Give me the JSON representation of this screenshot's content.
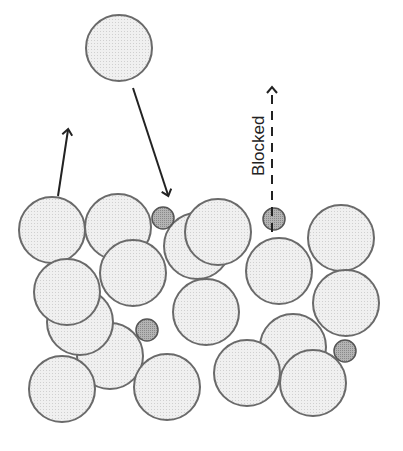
{
  "diagram": {
    "label_blocked": "Blocked",
    "colors": {
      "large_fill": "#ececec",
      "large_stroke": "#6a6a6a",
      "small_fill": "#a8a8a8",
      "small_stroke": "#555555",
      "arrow": "#222222"
    },
    "falling_particle": {
      "cx": 119,
      "cy": 48,
      "r": 33
    },
    "arrows": [
      {
        "name": "escape-arrow",
        "x1": 58,
        "y1": 196,
        "x2": 68,
        "y2": 130,
        "style": "solid"
      },
      {
        "name": "deposit-arrow",
        "x1": 133,
        "y1": 88,
        "x2": 168,
        "y2": 195,
        "style": "solid"
      },
      {
        "name": "blocked-arrow",
        "x1": 272,
        "y1": 232,
        "x2": 272,
        "y2": 88,
        "style": "dashed"
      }
    ],
    "large_particles": [
      {
        "cx": 52,
        "cy": 230,
        "r": 33
      },
      {
        "cx": 118,
        "cy": 227,
        "r": 33
      },
      {
        "cx": 197,
        "cy": 246,
        "r": 33
      },
      {
        "cx": 218,
        "cy": 232,
        "r": 33
      },
      {
        "cx": 110,
        "cy": 356,
        "r": 33
      },
      {
        "cx": 80,
        "cy": 322,
        "r": 33
      },
      {
        "cx": 67,
        "cy": 292,
        "r": 33
      },
      {
        "cx": 133,
        "cy": 273,
        "r": 33
      },
      {
        "cx": 206,
        "cy": 312,
        "r": 33
      },
      {
        "cx": 279,
        "cy": 271,
        "r": 33
      },
      {
        "cx": 341,
        "cy": 238,
        "r": 33
      },
      {
        "cx": 346,
        "cy": 303,
        "r": 33
      },
      {
        "cx": 293,
        "cy": 347,
        "r": 33
      },
      {
        "cx": 62,
        "cy": 389,
        "r": 33
      },
      {
        "cx": 167,
        "cy": 387,
        "r": 33
      },
      {
        "cx": 247,
        "cy": 373,
        "r": 33
      },
      {
        "cx": 313,
        "cy": 383,
        "r": 33
      }
    ],
    "small_particles": [
      {
        "cx": 163,
        "cy": 218,
        "r": 11
      },
      {
        "cx": 147,
        "cy": 330,
        "r": 11
      },
      {
        "cx": 274,
        "cy": 219,
        "r": 11
      },
      {
        "cx": 345,
        "cy": 351,
        "r": 11
      }
    ]
  }
}
